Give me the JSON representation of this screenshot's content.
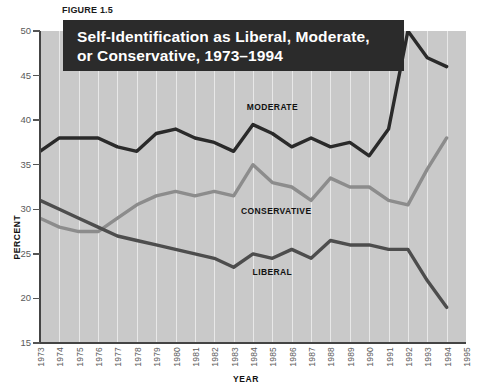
{
  "figure": {
    "caption": "FIGURE 1.5",
    "title_line1": "Self-Identification as Liberal, Moderate,",
    "title_line2": "or Conservative, 1973–1994"
  },
  "colors": {
    "plot_background": "#c9c9c9",
    "gridline": "#e8e8e8",
    "banner_background": "#2b2b2b",
    "banner_text": "#ffffff",
    "moderate": "#2a2a2a",
    "liberal": "#4d4d4d",
    "conservative": "#8c8c8c",
    "axis": "#444444",
    "tick_text": "#5a5a5a"
  },
  "chart_data": {
    "type": "line",
    "title": "Self-Identification as Liberal, Moderate, or Conservative, 1973–1994",
    "xlabel": "YEAR",
    "ylabel": "PERCENT",
    "ylim": [
      15,
      50
    ],
    "yticks": [
      15,
      20,
      25,
      30,
      35,
      40,
      45,
      50
    ],
    "xlim": [
      1973,
      1995
    ],
    "xticks": [
      1973,
      1974,
      1975,
      1976,
      1977,
      1978,
      1979,
      1980,
      1981,
      1982,
      1983,
      1984,
      1985,
      1986,
      1987,
      1988,
      1989,
      1990,
      1991,
      1992,
      1993,
      1994,
      1995
    ],
    "grid": "vertical",
    "legend_position": "inline-annotations",
    "x": [
      1973,
      1974,
      1975,
      1976,
      1977,
      1978,
      1979,
      1980,
      1981,
      1982,
      1983,
      1984,
      1985,
      1986,
      1987,
      1988,
      1989,
      1990,
      1991,
      1992,
      1993,
      1994
    ],
    "series": [
      {
        "name": "MODERATE",
        "color": "#2a2a2a",
        "values": [
          36.5,
          38.0,
          38.0,
          38.0,
          37.0,
          36.5,
          38.5,
          39.0,
          38.0,
          37.5,
          36.5,
          39.5,
          38.5,
          37.0,
          38.0,
          37.0,
          37.5,
          36.0,
          39.0,
          50.0,
          47.0,
          46.0
        ]
      },
      {
        "name": "CONSERVATIVE",
        "color": "#8c8c8c",
        "values": [
          29.0,
          28.0,
          27.5,
          27.5,
          29.0,
          30.5,
          31.5,
          32.0,
          31.5,
          32.0,
          31.5,
          35.0,
          33.0,
          32.5,
          31.0,
          33.5,
          32.5,
          32.5,
          31.0,
          30.5,
          34.5,
          38.0
        ]
      },
      {
        "name": "LIBERAL",
        "color": "#4d4d4d",
        "values": [
          31.0,
          30.0,
          29.0,
          28.0,
          27.0,
          26.5,
          26.0,
          25.5,
          25.0,
          24.5,
          23.5,
          25.0,
          24.5,
          25.5,
          24.5,
          26.5,
          26.0,
          26.0,
          25.5,
          25.5,
          22.0,
          19.0
        ]
      }
    ],
    "annotations": [
      {
        "text": "MODERATE",
        "x": 1985,
        "y": 41.5
      },
      {
        "text": "CONSERVATIVE",
        "x": 1985.2,
        "y": 29.8
      },
      {
        "text": "LIBERAL",
        "x": 1985,
        "y": 23.0
      }
    ]
  }
}
